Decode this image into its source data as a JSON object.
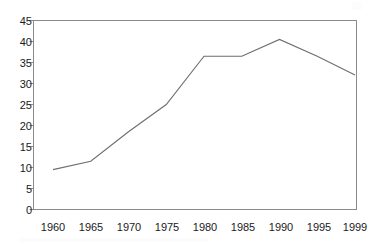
{
  "chart_data": {
    "type": "line",
    "title": "",
    "subtitle": "",
    "xlabel": "",
    "ylabel": "",
    "x": [
      1960,
      1965,
      1970,
      1975,
      1980,
      1985,
      1990,
      1995,
      1999
    ],
    "categories": [
      "1960",
      "1965",
      "1970",
      "1975",
      "1980",
      "1985",
      "1990",
      "1995",
      "1999"
    ],
    "values": [
      9.5,
      11.5,
      18.5,
      25,
      36.5,
      36.5,
      40.5,
      36.5,
      32
    ],
    "series": [
      {
        "name": "",
        "values": [
          9.5,
          11.5,
          18.5,
          25,
          36.5,
          36.5,
          40.5,
          36.5,
          32
        ],
        "color": "#6e6e6e"
      }
    ],
    "xlim": [
      1960,
      1999
    ],
    "ylim": [
      0,
      45
    ],
    "ytick_labels": [
      "0",
      "5",
      "10",
      "15",
      "20",
      "25",
      "30",
      "35",
      "40",
      "45"
    ],
    "ytick_values": [
      0,
      5,
      10,
      15,
      20,
      25,
      30,
      35,
      40,
      45
    ],
    "xtick_labels": [
      "1960",
      "1965",
      "1970",
      "1975",
      "1980",
      "1985",
      "1990",
      "1995",
      "1999"
    ],
    "grid": false,
    "legend": false,
    "legend_position": "none",
    "annotations": [],
    "frame": true,
    "line_color": "#6e6e6e",
    "axis_color": "#8a8a8a",
    "text_color": "#1a1a1a",
    "background_color": "#ffffff"
  }
}
